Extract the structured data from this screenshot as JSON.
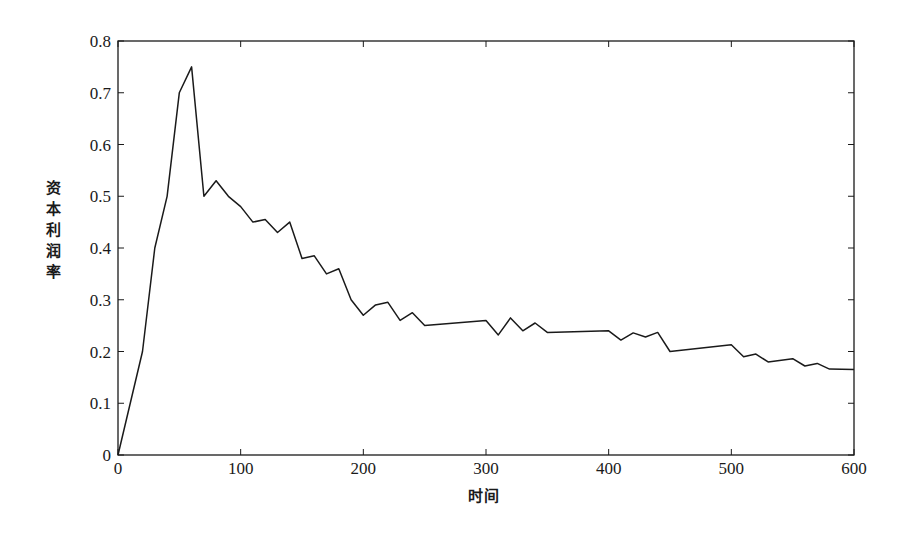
{
  "chart_data": {
    "type": "line",
    "title": "",
    "xlabel": "时间",
    "ylabel": "资本利润率",
    "xlim": [
      0,
      600
    ],
    "ylim": [
      0,
      0.8
    ],
    "grid": false,
    "legend": null,
    "x_ticks": [
      0,
      100,
      200,
      300,
      400,
      500,
      600
    ],
    "x_tick_labels": [
      "0",
      "100",
      "200",
      "300",
      "400",
      "500",
      "600"
    ],
    "y_ticks": [
      0,
      0.1,
      0.2,
      0.3,
      0.4,
      0.5,
      0.6,
      0.7,
      0.8
    ],
    "y_tick_labels": [
      "0",
      "0.1",
      "0.2",
      "0.3",
      "0.4",
      "0.5",
      "0.6",
      "0.7",
      "0.8"
    ],
    "series": [
      {
        "name": "资本利润率",
        "color": "#1a1a1a",
        "x": [
          0,
          20,
          30,
          40,
          50,
          60,
          70,
          80,
          90,
          100,
          110,
          120,
          130,
          140,
          150,
          160,
          170,
          180,
          190,
          200,
          210,
          220,
          230,
          240,
          250,
          300,
          310,
          320,
          330,
          340,
          350,
          400,
          410,
          420,
          430,
          440,
          450,
          500,
          510,
          520,
          530,
          550,
          560,
          570,
          580,
          600
        ],
        "values": [
          0,
          0.2,
          0.4,
          0.5,
          0.7,
          0.75,
          0.5,
          0.53,
          0.5,
          0.48,
          0.45,
          0.455,
          0.43,
          0.45,
          0.38,
          0.385,
          0.35,
          0.36,
          0.3,
          0.27,
          0.29,
          0.295,
          0.26,
          0.275,
          0.25,
          0.26,
          0.232,
          0.265,
          0.24,
          0.255,
          0.237,
          0.24,
          0.222,
          0.236,
          0.228,
          0.237,
          0.2,
          0.213,
          0.19,
          0.195,
          0.18,
          0.186,
          0.172,
          0.177,
          0.166,
          0.165
        ]
      }
    ]
  }
}
